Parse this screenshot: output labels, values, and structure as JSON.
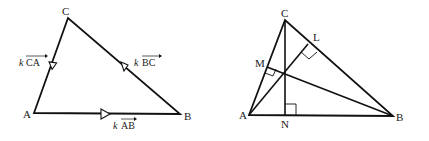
{
  "figure_left": {
    "title": "Triangle ABC with scaled side vectors",
    "vertices": {
      "A": {
        "label": "A",
        "x": 34,
        "y": 113
      },
      "B": {
        "label": "B",
        "x": 180,
        "y": 114
      },
      "C": {
        "label": "C",
        "x": 68,
        "y": 18
      }
    },
    "vector_labels": {
      "CA": {
        "scalar": "k",
        "vector": "CA"
      },
      "BC": {
        "scalar": "k",
        "vector": "BC"
      },
      "AB": {
        "scalar": "k",
        "vector": "AB"
      }
    },
    "arrow_markers": [
      "on CA pointing from C to A",
      "on BC pointing from B to C",
      "on AB pointing from A to B"
    ]
  },
  "figure_right": {
    "title": "Triangle ABC with altitudes AL, BM, CN meeting at orthocenter",
    "vertices": {
      "A": {
        "label": "A",
        "x": 249,
        "y": 115
      },
      "B": {
        "label": "B",
        "x": 393,
        "y": 116
      },
      "C": {
        "label": "C",
        "x": 285,
        "y": 20
      }
    },
    "feet": {
      "L": {
        "label": "L",
        "on": "BC"
      },
      "M": {
        "label": "M",
        "on": "CA"
      },
      "N": {
        "label": "N",
        "on": "AB"
      }
    },
    "altitudes": [
      "AL",
      "BM",
      "CN"
    ],
    "right_angle_marks": [
      "L",
      "M",
      "N"
    ]
  },
  "colors": {
    "line": "#111111",
    "background": "#ffffff"
  }
}
